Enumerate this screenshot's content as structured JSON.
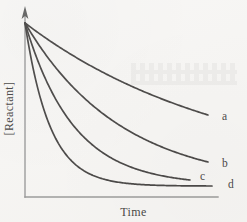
{
  "figure": {
    "background_color": "#f6f5f3",
    "curve_color": "#2f2d2c",
    "axis_color": "#8d8d8d",
    "text_color": "#2c2a29"
  },
  "axes": {
    "y_label": "[Reactant]",
    "x_label": "Time",
    "y_axis_has_arrow": true,
    "origin_px": [
      25,
      197
    ],
    "y_axis_top_px": 6,
    "x_axis_right_px": 218
  },
  "curves": [
    {
      "id": "a",
      "label": "a",
      "label_x": 222,
      "label_y": 120,
      "decay_rate": 0.9,
      "plateau": 0.36,
      "start_px": [
        25,
        23
      ],
      "end_px": [
        208,
        115
      ]
    },
    {
      "id": "b",
      "label": "b",
      "label_x": 222,
      "label_y": 167,
      "decay_rate": 1.9,
      "plateau": 0.1,
      "start_px": [
        25,
        23
      ],
      "end_px": [
        208,
        162
      ]
    },
    {
      "id": "c",
      "label": "c",
      "label_x": 200,
      "label_y": 180,
      "decay_rate": 3.4,
      "plateau": 0.02,
      "start_px": [
        25,
        23
      ],
      "end_px": [
        190,
        180
      ]
    },
    {
      "id": "d",
      "label": "d",
      "label_x": 228,
      "label_y": 188,
      "decay_rate": 7.5,
      "plateau": 0.0,
      "start_px": [
        25,
        23
      ],
      "end_px": [
        212,
        186
      ]
    }
  ],
  "chart_data": {
    "type": "line",
    "title": "",
    "xlabel": "Time",
    "ylabel": "[Reactant]",
    "xlim": [
      0,
      1
    ],
    "ylim": [
      0,
      1
    ],
    "grid": false,
    "legend": "inline-right-end-labels",
    "axis_ticks": "none",
    "x": [
      0,
      0.05,
      0.1,
      0.15,
      0.2,
      0.25,
      0.3,
      0.35,
      0.4,
      0.45,
      0.5,
      0.55,
      0.6,
      0.65,
      0.7,
      0.75,
      0.8,
      0.85,
      0.9,
      0.95,
      1
    ],
    "series": [
      {
        "name": "a",
        "decay_rate": 0.9,
        "plateau": 0.36,
        "values": [
          1.0,
          0.972,
          0.945,
          0.919,
          0.895,
          0.872,
          0.849,
          0.828,
          0.808,
          0.789,
          0.771,
          0.753,
          0.737,
          0.721,
          0.706,
          0.692,
          0.678,
          0.665,
          0.653,
          0.641,
          0.63
        ]
      },
      {
        "name": "b",
        "decay_rate": 1.9,
        "plateau": 0.1,
        "values": [
          1.0,
          0.919,
          0.844,
          0.776,
          0.714,
          0.657,
          0.605,
          0.557,
          0.513,
          0.473,
          0.437,
          0.403,
          0.373,
          0.345,
          0.319,
          0.296,
          0.274,
          0.255,
          0.237,
          0.221,
          0.206
        ]
      },
      {
        "name": "c",
        "decay_rate": 3.4,
        "plateau": 0.02,
        "values": [
          1.0,
          0.847,
          0.718,
          0.61,
          0.519,
          0.443,
          0.378,
          0.324,
          0.278,
          0.239,
          0.206,
          0.179,
          0.155,
          0.136,
          0.119,
          0.105,
          0.093,
          0.083,
          0.074,
          0.067,
          0.061
        ]
      },
      {
        "name": "d",
        "decay_rate": 7.5,
        "plateau": 0.0,
        "values": [
          1.0,
          0.687,
          0.472,
          0.325,
          0.223,
          0.153,
          0.105,
          0.072,
          0.05,
          0.034,
          0.024,
          0.016,
          0.011,
          0.008,
          0.005,
          0.004,
          0.002,
          0.002,
          0.001,
          0.001,
          0.001
        ]
      }
    ]
  }
}
